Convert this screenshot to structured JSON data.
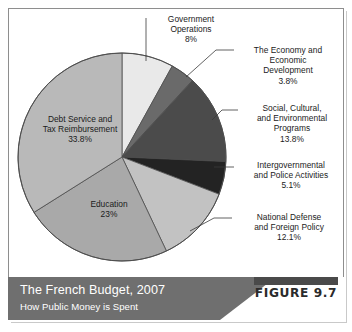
{
  "figure": {
    "tag": "FIGURE 9.7",
    "title": "The French Budget, 2007",
    "subtitle": "How Public Money is Spent"
  },
  "chart_data": {
    "type": "pie",
    "title": "The French Budget, 2007",
    "subtitle": "How Public Money is Spent",
    "legend_position": "callout-labels",
    "units": "percent",
    "total": 100,
    "categories": [
      "Government Operations",
      "The Economy and Economic Development",
      "Social, Cultural, and Environmental Programs",
      "Intergovernmental and Police Activities",
      "National Defense and Foreign Policy",
      "Education",
      "Debt Service and Tax Reimbursement"
    ],
    "values": [
      8,
      3.8,
      13.8,
      5.1,
      12.1,
      23,
      33.8
    ],
    "colors": [
      "#e9e9e9",
      "#6a6a6a",
      "#4b4b4b",
      "#232323",
      "#c2c2c2",
      "#a9a9a9",
      "#b9b9b9"
    ],
    "slices": [
      {
        "name": "Government Operations",
        "label_line1": "Government",
        "label_line2": "Operations",
        "value_label": "8%",
        "value": 8,
        "color": "#e9e9e9",
        "label_position": "outside-top"
      },
      {
        "name": "The Economy and Economic Development",
        "label_line1": "The Economy and",
        "label_line2": "Economic",
        "label_line3": "Development",
        "value_label": "3.8%",
        "value": 3.8,
        "color": "#6a6a6a",
        "label_position": "outside-right"
      },
      {
        "name": "Social, Cultural, and Environmental Programs",
        "label_line1": "Social, Cultural,",
        "label_line2": "and Environmental",
        "label_line3": "Programs",
        "value_label": "13.8%",
        "value": 13.8,
        "color": "#4b4b4b",
        "label_position": "outside-right"
      },
      {
        "name": "Intergovernmental and Police Activities",
        "label_line1": "Intergovernmental",
        "label_line2": "and Police Activities",
        "value_label": "5.1%",
        "value": 5.1,
        "color": "#232323",
        "label_position": "outside-right"
      },
      {
        "name": "National Defense and Foreign Policy",
        "label_line1": "National Defense",
        "label_line2": "and Foreign Policy",
        "value_label": "12.1%",
        "value": 12.1,
        "color": "#c2c2c2",
        "label_position": "outside-right"
      },
      {
        "name": "Education",
        "label_line1": "Education",
        "value_label": "23%",
        "value": 23,
        "color": "#a9a9a9",
        "label_position": "inside"
      },
      {
        "name": "Debt Service and Tax Reimbursement",
        "label_line1": "Debt Service and",
        "label_line2": "Tax Reimbursement",
        "value_label": "33.8%",
        "value": 33.8,
        "color": "#b9b9b9",
        "label_position": "inside"
      }
    ]
  },
  "labels": {
    "government": "Government\nOperations\n8%",
    "economy": "The Economy and\nEconomic\nDevelopment\n3.8%",
    "social": "Social, Cultural,\nand Environmental\nPrograms\n13.8%",
    "intergov": "Intergovernmental\nand Police Activities\n5.1%",
    "defense": "National Defense\nand Foreign Policy\n12.1%",
    "debt": "Debt Service and\nTax Reimbursement\n33.8%",
    "education": "Education\n23%"
  }
}
